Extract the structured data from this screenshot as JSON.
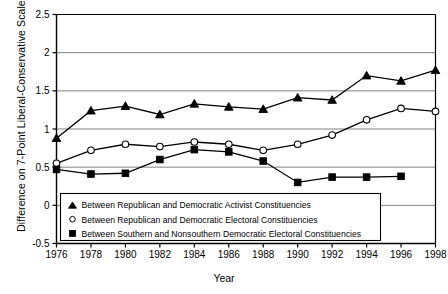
{
  "chart_data": {
    "type": "line",
    "title": "",
    "xlabel": "Year",
    "ylabel": "Difference on 7-Point Liberal-Conservative Scale",
    "x": [
      1976,
      1978,
      1980,
      1982,
      1984,
      1986,
      1988,
      1990,
      1992,
      1994,
      1996,
      1998
    ],
    "xlim": [
      1976,
      1998
    ],
    "ylim": [
      -0.5,
      2.5
    ],
    "yticks": [
      -0.5,
      0,
      0.5,
      1,
      1.5,
      2,
      2.5
    ],
    "ytick_labels": [
      "-0.5",
      "0",
      "0.5",
      "1",
      "1.5",
      "2",
      "2.5"
    ],
    "xticks": [
      1976,
      1978,
      1980,
      1982,
      1984,
      1986,
      1988,
      1990,
      1992,
      1994,
      1996,
      1998
    ],
    "xtick_labels": [
      "1976",
      "1978",
      "1980",
      "1982",
      "1984",
      "1986",
      "1988",
      "1990",
      "1992",
      "1994",
      "1996",
      "1998"
    ],
    "grid": true,
    "grid_axis": "y",
    "legend_position": "lower-left-inside",
    "series": [
      {
        "name": "Between Republican and Democratic Activist Constituencies",
        "marker": "triangle",
        "marker_fill": "#000000",
        "color": "#000000",
        "values": [
          0.88,
          1.24,
          1.3,
          1.19,
          1.33,
          1.29,
          1.26,
          1.41,
          1.38,
          1.7,
          1.63,
          1.77
        ]
      },
      {
        "name": "Between Republican and Democratic Electoral Constituencies",
        "marker": "circle",
        "marker_fill": "#ffffff",
        "color": "#000000",
        "values": [
          0.55,
          0.72,
          0.8,
          0.77,
          0.83,
          0.8,
          0.72,
          0.8,
          0.92,
          1.12,
          1.27,
          1.23
        ]
      },
      {
        "name": "Between Southern and Nonsouthern Democratic Electoral Constituencies",
        "marker": "square",
        "marker_fill": "#000000",
        "color": "#000000",
        "values": [
          0.47,
          0.41,
          0.42,
          0.6,
          0.73,
          0.7,
          0.58,
          0.3,
          0.37,
          0.37,
          0.38,
          null
        ]
      }
    ]
  },
  "legend": {
    "entries": [
      {
        "marker": "triangle",
        "label": "Between Republican and Democratic Activist Constituencies"
      },
      {
        "marker": "circle",
        "label": "Between Republican and Democratic Electoral Constituencies"
      },
      {
        "marker": "square",
        "label": "Between Southern and Nonsouthern Democratic Electoral Constituencies"
      }
    ]
  },
  "axes": {
    "x_title": "Year",
    "y_title": "Difference on 7-Point Liberal-Conservative Scale"
  }
}
